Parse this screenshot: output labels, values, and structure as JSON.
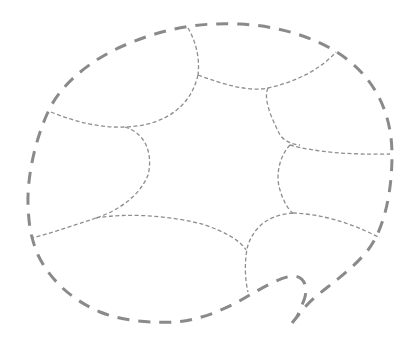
{
  "diagram": {
    "outline_color": "#8a8a8a",
    "divider_color": "#8e8e8e",
    "background": "#ffffff",
    "regions": 7
  }
}
